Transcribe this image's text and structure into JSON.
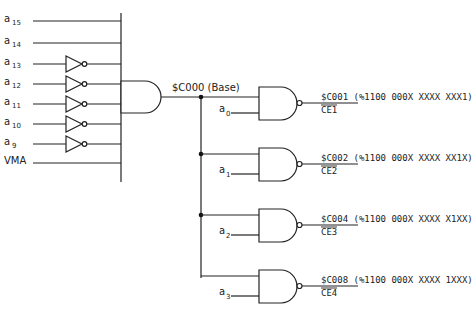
{
  "diagram": {
    "inputs": [
      {
        "name": "a",
        "sub": "15",
        "inverted": false
      },
      {
        "name": "a",
        "sub": "14",
        "inverted": false
      },
      {
        "name": "a",
        "sub": "13",
        "inverted": true
      },
      {
        "name": "a",
        "sub": "12",
        "inverted": true
      },
      {
        "name": "a",
        "sub": "11",
        "inverted": true
      },
      {
        "name": "a",
        "sub": "10",
        "inverted": true
      },
      {
        "name": "a",
        "sub": "9",
        "inverted": true
      },
      {
        "name": "VMA",
        "sub": "",
        "inverted": false
      }
    ],
    "base_label": "$C000 (Base)",
    "outputs": [
      {
        "input": "a",
        "sub": "0",
        "address": "$C001 (%1100 000X XXXX XXX1)",
        "ce": "CE1"
      },
      {
        "input": "a",
        "sub": "1",
        "address": "$C002 (%1100 000X XXXX XX1X)",
        "ce": "CE2"
      },
      {
        "input": "a",
        "sub": "2",
        "address": "$C004 (%1100 000X XXXX X1XX)",
        "ce": "CE3"
      },
      {
        "input": "a",
        "sub": "3",
        "address": "$C008 (%1100 000X XXXX 1XXX)",
        "ce": "CE4"
      }
    ]
  }
}
